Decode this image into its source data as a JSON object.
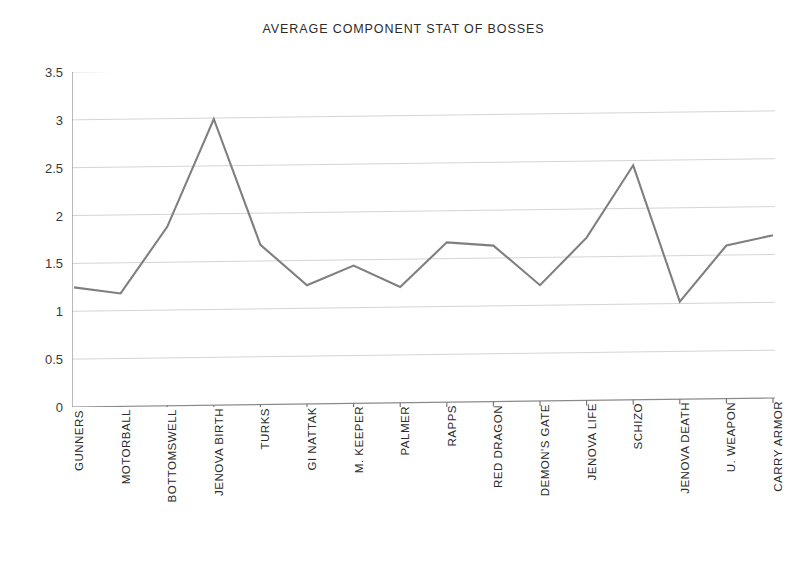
{
  "chart_data": {
    "type": "line",
    "title": "AVERAGE COMPONENT STAT OF BOSSES",
    "xlabel": "",
    "ylabel": "",
    "ylim": [
      0,
      3.5
    ],
    "yticks": [
      "0",
      "0.5",
      "1",
      "1.5",
      "2",
      "2.5",
      "3",
      "3.5"
    ],
    "ytick_values": [
      0,
      0.5,
      1,
      1.5,
      2,
      2.5,
      3,
      3.5
    ],
    "grid": true,
    "legend": "none",
    "line_color": "#7f7f7f",
    "categories": [
      "GUNNERS",
      "MOTORBALL",
      "BOTTOMSWELL",
      "JENOVA BIRTH",
      "TURKS",
      "GI NATTAK",
      "M. KEEPER",
      "PALMER",
      "RAPPS",
      "RED DRAGON",
      "DEMON'S GATE",
      "JENOVA LIFE",
      "SCHIZO",
      "JENOVA DEATH",
      "U. WEAPON",
      "CARRY ARMOR"
    ],
    "series": [
      {
        "name": "Average Component Stat",
        "values": [
          1.25,
          1.18,
          1.87,
          2.99,
          1.67,
          1.24,
          1.44,
          1.21,
          1.67,
          1.63,
          1.21,
          1.7,
          2.45,
          1.02,
          1.6,
          1.7
        ]
      }
    ]
  }
}
